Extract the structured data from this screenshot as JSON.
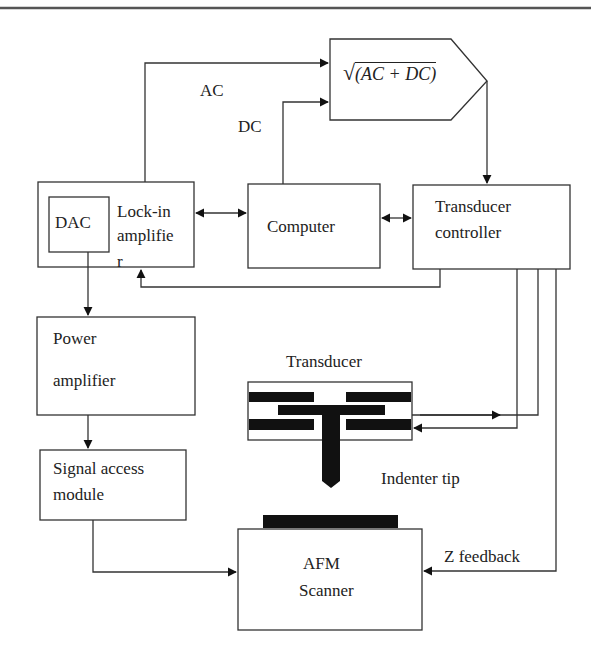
{
  "diagram": {
    "type": "block-diagram",
    "formula_block": {
      "label": "√(AC + DC)",
      "radicand": "(AC + DC)",
      "radical": "√"
    },
    "signals": {
      "ac": "AC",
      "dc": "DC",
      "z_feedback": "Z feedback"
    },
    "blocks": {
      "dac": "DAC",
      "lockin_line1": "Lock-in",
      "lockin_line2": "amplifie",
      "lockin_line3": "r",
      "computer": "Computer",
      "controller_line1": "Transducer",
      "controller_line2": "controller",
      "power_line1": "Power",
      "power_line2": "amplifier",
      "signal_line1": "Signal access",
      "signal_line2": "module",
      "transducer": "Transducer",
      "indenter": "Indenter tip",
      "afm_line1": "AFM",
      "afm_line2": "Scanner"
    },
    "colors": {
      "stroke": "#333333",
      "fill_dark": "#111111",
      "background": "#ffffff"
    }
  }
}
